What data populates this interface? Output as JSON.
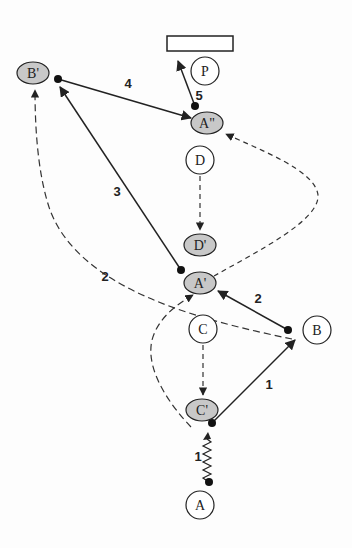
{
  "diagram": {
    "colors": {
      "stroke": "#222222",
      "shaded_fill": "#c8c8c8",
      "plain_fill": "#ffffff",
      "background": "#fdfdfd"
    },
    "nodes": {
      "P": {
        "label": "P",
        "shaded": false
      },
      "B_prime": {
        "label": "B'",
        "shaded": true
      },
      "A_double_prime": {
        "label": "A\"",
        "shaded": true
      },
      "D": {
        "label": "D",
        "shaded": false
      },
      "D_prime": {
        "label": "D'",
        "shaded": true
      },
      "A_prime": {
        "label": "A'",
        "shaded": true
      },
      "C": {
        "label": "C",
        "shaded": false
      },
      "B": {
        "label": "B",
        "shaded": false
      },
      "C_prime": {
        "label": "C'",
        "shaded": true
      },
      "A": {
        "label": "A",
        "shaded": false
      }
    },
    "edge_labels": {
      "C_prime_to_B": "1",
      "A_to_C_prime_spring": "1",
      "B_to_A_prime": "2",
      "dashed_A_prime_to_B_prime": "2",
      "A_prime_to_B_prime": "3",
      "B_prime_to_A_double_prime": "4",
      "A_double_prime_to_rect": "5"
    },
    "edges": [
      {
        "from": "C'",
        "to": "B",
        "style": "solid",
        "label": "1"
      },
      {
        "from": "A",
        "to": "C'",
        "style": "spring",
        "label": "1"
      },
      {
        "from": "B",
        "to": "A'",
        "style": "solid",
        "label": "2"
      },
      {
        "from": "B",
        "to": "B'",
        "style": "dashed",
        "label": "2"
      },
      {
        "from": "A'",
        "to": "B'",
        "style": "solid",
        "label": "3"
      },
      {
        "from": "B'",
        "to": "A\"",
        "style": "solid",
        "label": "4"
      },
      {
        "from": "A\"",
        "to": "rectangle",
        "style": "solid",
        "label": "5"
      },
      {
        "from": "D",
        "to": "D'",
        "style": "dashed",
        "label": ""
      },
      {
        "from": "C",
        "to": "C'",
        "style": "dashed",
        "label": ""
      },
      {
        "from": "A'",
        "to": "A\"",
        "style": "dashed",
        "label": ""
      },
      {
        "from": "C'",
        "to": "A'",
        "style": "dashed",
        "label": ""
      }
    ]
  }
}
